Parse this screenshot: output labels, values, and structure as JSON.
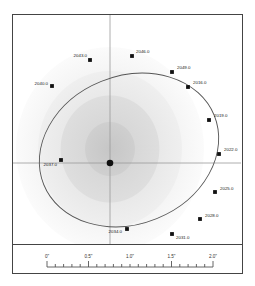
{
  "figure": {
    "type": "orbit-diagram",
    "title": "",
    "center_marker": "primary-star"
  },
  "chart_data": {
    "type": "scatter",
    "title": "",
    "xlabel": "",
    "ylabel": "",
    "axes": {
      "crosshair_center_px": [
        97,
        148
      ],
      "grid": false,
      "legend": "none"
    },
    "scale_bar": {
      "unit": "arcsec",
      "tick_labels": [
        "0\"",
        "0.5\"",
        "1.0\"",
        "1.5\"",
        "2.0\""
      ],
      "tick_values": [
        0,
        0.5,
        1.0,
        1.5,
        2.0
      ],
      "minor_ticks_per_major": 5,
      "range": [
        0,
        2.0
      ]
    },
    "ellipse": {
      "center_px": [
        116,
        135
      ],
      "semi_major_px": 92,
      "semi_minor_px": 74,
      "rotation_deg": -22
    },
    "categories": [
      "2016.0",
      "2019.0",
      "2022.0",
      "2025.0",
      "2028.0",
      "2031.0",
      "2034.0",
      "2037.0",
      "2040.0",
      "2043.0",
      "2046.0",
      "2049.0"
    ],
    "points": [
      {
        "label": "2016.0",
        "x": 175,
        "y": 72,
        "label_dx": 5,
        "label_dy": -3,
        "anchor": "start"
      },
      {
        "label": "2019.0",
        "x": 196,
        "y": 105,
        "label_dx": 5,
        "label_dy": -3,
        "anchor": "start"
      },
      {
        "label": "2022.0",
        "x": 206,
        "y": 139,
        "label_dx": 5,
        "label_dy": -3,
        "anchor": "start"
      },
      {
        "label": "2025.0",
        "x": 202,
        "y": 177,
        "label_dx": 5,
        "label_dy": -2,
        "anchor": "start"
      },
      {
        "label": "2028.0",
        "x": 187,
        "y": 204,
        "label_dx": 5,
        "label_dy": -2,
        "anchor": "start"
      },
      {
        "label": "2031.0",
        "x": 159,
        "y": 219,
        "label_dx": 4,
        "label_dy": 5,
        "anchor": "start"
      },
      {
        "label": "2034.0",
        "x": 114,
        "y": 214,
        "label_dx": -5,
        "label_dy": 4,
        "anchor": "end"
      },
      {
        "label": "2037.0",
        "x": 48,
        "y": 145,
        "label_dx": -4,
        "label_dy": 6,
        "anchor": "end"
      },
      {
        "label": "2040.0",
        "x": 39,
        "y": 71,
        "label_dx": -4,
        "label_dy": -1,
        "anchor": "end"
      },
      {
        "label": "2043.0",
        "x": 77,
        "y": 45,
        "label_dx": -3,
        "label_dy": -3,
        "anchor": "end"
      },
      {
        "label": "2046.0",
        "x": 119,
        "y": 41,
        "label_dx": 4,
        "label_dy": -3,
        "anchor": "start"
      },
      {
        "label": "2049.0",
        "x": 159,
        "y": 57,
        "label_dx": 5,
        "label_dy": -3,
        "anchor": "start"
      }
    ],
    "values": [
      2016.0,
      2019.0,
      2022.0,
      2025.0,
      2028.0,
      2031.0,
      2034.0,
      2037.0,
      2040.0,
      2043.0,
      2046.0,
      2049.0
    ]
  },
  "colors": {
    "frame": "#444444",
    "orbit_line": "#555555",
    "marker": "#111111",
    "axis_line": "#999999",
    "halo_outer": "#f2f2f2",
    "halo_mid": "#e4e4e4",
    "halo_inner": "#d6d6d6",
    "halo_core": "#c9c9c9",
    "tick": "#555555",
    "label_text": "#1a1a1a",
    "background": "#ffffff"
  },
  "scale": {
    "ticks": [
      {
        "label": "0\"",
        "value": 0
      },
      {
        "label": "0.5\"",
        "value": 0.5
      },
      {
        "label": "1.0\"",
        "value": 1.0
      },
      {
        "label": "1.5\"",
        "value": 1.5
      },
      {
        "label": "2.0\"",
        "value": 2.0
      }
    ]
  }
}
